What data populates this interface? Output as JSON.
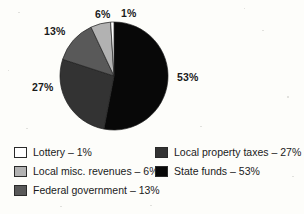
{
  "chart_data": {
    "type": "pie",
    "title": "",
    "categories": [
      "State funds",
      "Local property taxes",
      "Federal government",
      "Local misc. revenues",
      "Lottery"
    ],
    "values": [
      53,
      27,
      13,
      6,
      1
    ],
    "value_suffix": "%",
    "legend_position": "bottom",
    "grid": false,
    "slices": [
      {
        "label": "State funds",
        "value": 53,
        "value_text": "53%",
        "color": "#080808",
        "start_angle": 0,
        "end_angle": 190.8
      },
      {
        "label": "Local property taxes",
        "value": 27,
        "value_text": "27%",
        "color": "#333333",
        "start_angle": 190.8,
        "end_angle": 288.0
      },
      {
        "label": "Federal government",
        "value": 13,
        "value_text": "13%",
        "color": "#595959",
        "start_angle": 288.0,
        "end_angle": 334.8
      },
      {
        "label": "Local misc. revenues",
        "value": 6,
        "value_text": "6%",
        "color": "#b2b2b2",
        "start_angle": 334.8,
        "end_angle": 356.4
      },
      {
        "label": "Lottery",
        "value": 1,
        "value_text": "1%",
        "color": "#ffffff",
        "start_angle": 356.4,
        "end_angle": 360.0
      }
    ],
    "callouts": [
      {
        "name": "lottery",
        "text": "1%"
      },
      {
        "name": "misc",
        "text": "6%"
      },
      {
        "name": "federal",
        "text": "13%"
      },
      {
        "name": "property",
        "text": "27%"
      },
      {
        "name": "state",
        "text": "53%"
      }
    ]
  },
  "legend": {
    "left_column": [
      {
        "label": "Lottery – 1%",
        "color": "#ffffff"
      },
      {
        "label": "Local misc. revenues – 6%",
        "color": "#b2b2b2"
      },
      {
        "label": "Federal government – 13%",
        "color": "#595959"
      }
    ],
    "right_column": [
      {
        "label": "Local property taxes – 27%",
        "color": "#333333"
      },
      {
        "label": "State funds – 53%",
        "color": "#080808"
      }
    ]
  }
}
